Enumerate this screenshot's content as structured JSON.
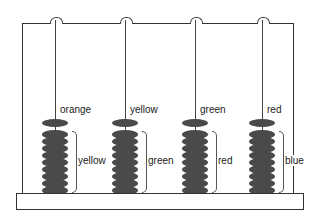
{
  "diagram": {
    "type": "abacus",
    "rods": [
      {
        "x": 55,
        "top_label": "orange",
        "stack_label": "yellow",
        "single_beads": 1,
        "stack_beads": 9
      },
      {
        "x": 125,
        "top_label": "yellow",
        "stack_label": "green",
        "single_beads": 1,
        "stack_beads": 9
      },
      {
        "x": 195,
        "top_label": "green",
        "stack_label": "red",
        "single_beads": 1,
        "stack_beads": 9
      },
      {
        "x": 262,
        "top_label": "red",
        "stack_label": "blue",
        "single_beads": 1,
        "stack_beads": 9
      }
    ],
    "colors": {
      "line": "#333333",
      "bead": "#4a4a4a",
      "background": "#ffffff"
    }
  }
}
